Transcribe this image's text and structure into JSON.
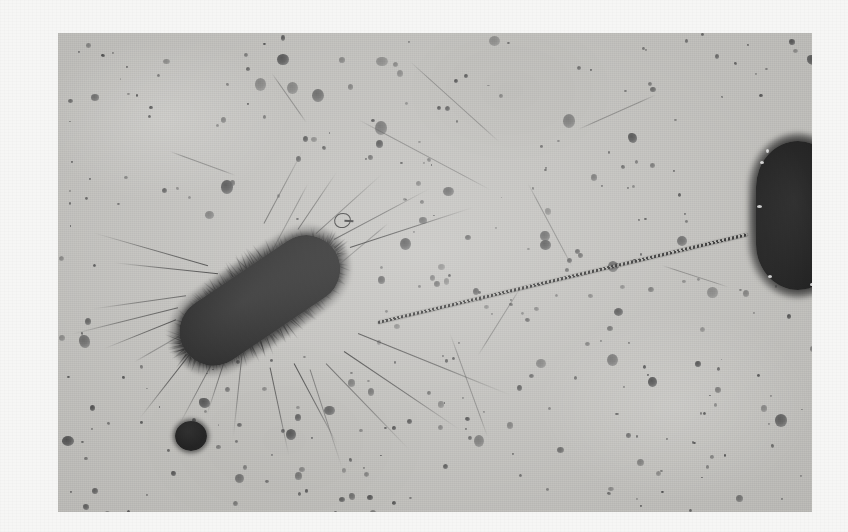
{
  "figure": {
    "kind": "transmission-electron-micrograph",
    "caption": "",
    "plate": {
      "left": 58,
      "top": 33,
      "width": 754,
      "height": 479,
      "background_color": "#bdbcb8",
      "page_color": "#f6f6f5"
    },
    "objects": [
      {
        "name": "donor-cell",
        "label": "fimbriated rod-shaped bacterium (donor)",
        "shape": "rod",
        "surface": "densely covered in short fimbriae and long pili",
        "center_x": 201,
        "center_y": 268,
        "length": 210,
        "height": 92,
        "rotation_deg": -34,
        "color": "#101010"
      },
      {
        "name": "polar-blob",
        "label": "small dark spherical body at cell pole",
        "shape": "sphere",
        "center_x": 133,
        "center_y": 403,
        "diameter": 31,
        "color": "#111111"
      },
      {
        "name": "recipient-cell",
        "label": "smooth oval bacterium (recipient)",
        "shape": "capsule",
        "surface": "smooth, no visible fimbriae",
        "center_x": 740,
        "center_y": 182,
        "width": 100,
        "height": 165,
        "rotation_deg": 0,
        "color": "#121212"
      },
      {
        "name": "conjugative-pilus",
        "label": "beaded conjugative pilus bridging the two cells",
        "shape": "filament",
        "start_x": 320,
        "start_y": 288,
        "end_x": 690,
        "end_y": 200,
        "thickness": 3.4,
        "appearance": "granular / phage-decorated",
        "color": "#191919"
      },
      {
        "name": "curled-particle",
        "label": "small curled stain artefact",
        "center_x": 283,
        "center_y": 186,
        "diameter": 14,
        "color": "#2b2b2b"
      }
    ],
    "background_particles_note": "scattered dark negative-stain grains and phage particles, 2-12 px across",
    "colors": {
      "cell_dark": "#101010",
      "plate_gray": "#bdbcb8",
      "particle_gray": "#4c4c4c",
      "page_white": "#f6f6f5"
    }
  }
}
